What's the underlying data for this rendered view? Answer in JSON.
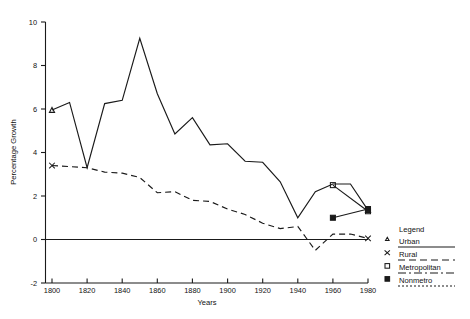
{
  "chart_data": {
    "type": "line",
    "title": "",
    "xlabel": "Years",
    "ylabel": "Percentage Growth",
    "xlim": [
      1795,
      1985
    ],
    "ylim": [
      -2,
      10
    ],
    "xticks": [
      1800,
      1820,
      1840,
      1860,
      1880,
      1900,
      1920,
      1940,
      1960,
      1980
    ],
    "yticks": [
      -2,
      0,
      2,
      4,
      6,
      8,
      10
    ],
    "grid": false,
    "legend_position": "right",
    "series": [
      {
        "name": "Urban",
        "marker": "triangle",
        "linestyle": "solid",
        "x": [
          1800,
          1810,
          1820,
          1830,
          1840,
          1850,
          1860,
          1870,
          1880,
          1890,
          1900,
          1910,
          1920,
          1930,
          1940,
          1950,
          1960,
          1970,
          1980
        ],
        "values": [
          5.95,
          6.3,
          3.3,
          6.25,
          6.4,
          9.25,
          6.7,
          4.85,
          5.6,
          4.35,
          4.4,
          3.6,
          3.55,
          2.65,
          1.0,
          2.2,
          2.55,
          2.55,
          1.35
        ]
      },
      {
        "name": "Rural",
        "marker": "x",
        "linestyle": "dashed",
        "x": [
          1800,
          1810,
          1820,
          1830,
          1840,
          1850,
          1860,
          1870,
          1880,
          1890,
          1900,
          1910,
          1920,
          1930,
          1940,
          1950,
          1960,
          1970,
          1980
        ],
        "values": [
          3.4,
          3.35,
          3.3,
          3.1,
          3.05,
          2.85,
          2.15,
          2.2,
          1.8,
          1.75,
          1.4,
          1.15,
          0.75,
          0.5,
          0.6,
          -0.5,
          0.25,
          0.25,
          0.05
        ]
      },
      {
        "name": "Metropolitan",
        "marker": "square",
        "linestyle": "dash-dot",
        "x": [
          1960,
          1980
        ],
        "values": [
          2.5,
          1.3
        ]
      },
      {
        "name": "Nonmetro",
        "marker": "square-filled",
        "linestyle": "dotted",
        "x": [
          1960,
          1980
        ],
        "values": [
          1.0,
          1.4
        ]
      }
    ]
  },
  "legend": {
    "title": "Legend",
    "entries": [
      {
        "label": "Urban",
        "marker": "triangle-icon"
      },
      {
        "label": "Rural",
        "marker": "x-icon"
      },
      {
        "label": "Metropolitan",
        "marker": "square-icon"
      },
      {
        "label": "Nonmetro",
        "marker": "square-filled-icon"
      }
    ]
  },
  "axes": {
    "y_title": "Percentage Growth",
    "x_title": "Years",
    "xticklabels": [
      "1800",
      "1820",
      "1840",
      "1860",
      "1880",
      "1900",
      "1920",
      "1940",
      "1960",
      "1980"
    ],
    "yticklabels": [
      "-2",
      "0",
      "2",
      "4",
      "6",
      "8",
      "10"
    ]
  },
  "colors": {
    "ink": "#1a1a1a",
    "background": "#ffffff"
  }
}
